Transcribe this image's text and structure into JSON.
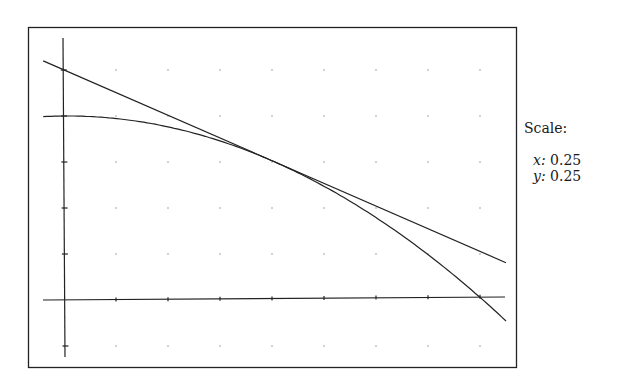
{
  "scale": {
    "title": "Scale:",
    "x_label": "x:",
    "x_value": "0.25",
    "y_label": "y:",
    "y_value": "0.25"
  },
  "chart_data": {
    "type": "line",
    "title": "",
    "xlabel": "",
    "ylabel": "",
    "grid": "dots",
    "tick_spacing": {
      "x": 0.25,
      "y": 0.25
    },
    "xlim": [
      -0.1,
      2.125
    ],
    "ylim": [
      -0.3,
      1.45
    ],
    "series": [
      {
        "name": "curve",
        "description": "y = 1 - x^2/4",
        "x": [
          -0.1,
          0,
          0.25,
          0.5,
          0.75,
          1.0,
          1.25,
          1.5,
          1.75,
          2.0,
          2.125
        ],
        "y": [
          0.9975,
          1.0,
          0.984,
          0.9375,
          0.859,
          0.75,
          0.609,
          0.4375,
          0.234,
          0.0,
          -0.129
        ]
      },
      {
        "name": "tangent line at x=1",
        "description": "y = 1.25 - 0.5x",
        "x": [
          -0.1,
          2.125
        ],
        "y": [
          1.3,
          0.1875
        ]
      }
    ]
  }
}
